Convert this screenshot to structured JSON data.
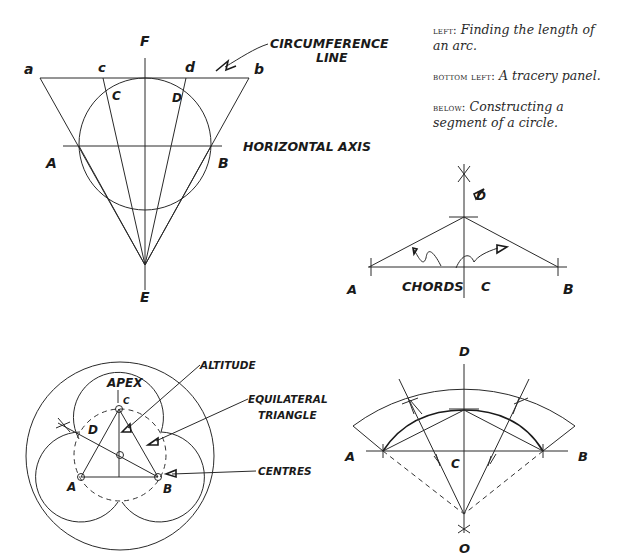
{
  "captions": [
    {
      "lead": "left:",
      "text": "Finding the length of an arc."
    },
    {
      "lead": "bottom left:",
      "text": "A tracery panel."
    },
    {
      "lead": "below:",
      "text": "Constructing a segment of a circle."
    }
  ],
  "diagram_arc": {
    "labels": {
      "F": "F",
      "E": "E",
      "a": "a",
      "b": "b",
      "c_top": "c",
      "d_top": "d",
      "C": "C",
      "D": "D",
      "A": "A",
      "B": "B"
    },
    "annotations": {
      "circumference_1": "CIRCUMFERENCE",
      "circumference_2": "LINE",
      "horizontal_axis": "HORIZONTAL AXIS"
    }
  },
  "diagram_chords": {
    "labels": {
      "D": "D",
      "A": "A",
      "B": "B",
      "C": "C"
    },
    "annotations": {
      "chords": "CHORDS"
    }
  },
  "diagram_tracery": {
    "labels": {
      "apex": "APEX",
      "C": "C",
      "D": "D",
      "A": "A",
      "B": "B"
    },
    "annotations": {
      "altitude": "ALTITUDE",
      "equilateral_1": "EQUILATERAL",
      "equilateral_2": "TRIANGLE",
      "centres": "CENTRES"
    }
  },
  "diagram_segment": {
    "labels": {
      "D": "D",
      "A": "A",
      "B": "B",
      "C": "C",
      "O": "O"
    }
  }
}
